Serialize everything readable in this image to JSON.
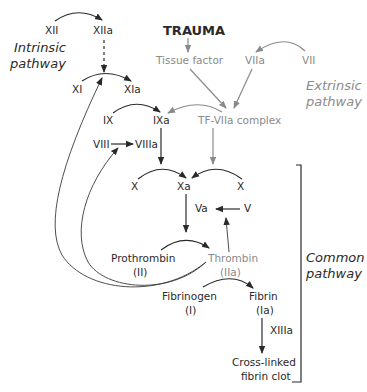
{
  "title": "TRAUMA",
  "pathways": {
    "intrinsic": [
      "Intrinsic",
      "pathway"
    ],
    "extrinsic": [
      "Extrinsic",
      "pathway"
    ],
    "common": [
      "Common",
      "pathway"
    ]
  },
  "factors": {
    "xii": "XII",
    "xiia": "XIIa",
    "xi": "XI",
    "xia": "XIa",
    "ix": "IX",
    "ixa": "IXa",
    "viii": "VIII",
    "viiia": "VIIIa",
    "tissue_factor": "Tissue factor",
    "viia": "VIIa",
    "vii": "VII",
    "tf_complex": "TF-VIIa complex",
    "x_left": "X",
    "xa": "Xa",
    "x_right": "X",
    "va": "Va",
    "v": "V",
    "prothrombin": [
      "Prothrombin",
      "(II)"
    ],
    "thrombin": [
      "Thrombin",
      "(IIa)"
    ],
    "fibrinogen": [
      "Fibrinogen",
      "(I)"
    ],
    "fibrin": [
      "Fibrin",
      "(Ia)"
    ],
    "xiiia": "XIIIa",
    "clot": [
      "Cross-linked",
      "fibrin clot"
    ]
  },
  "colors": {
    "dark": "#2a2a2a",
    "grey": "#8a8a8a"
  }
}
